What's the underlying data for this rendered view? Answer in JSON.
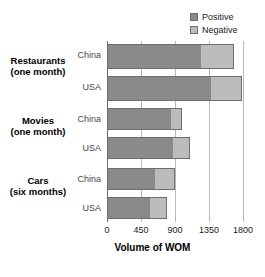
{
  "chart_data": {
    "type": "bar",
    "orientation": "horizontal",
    "stacked": true,
    "title": "",
    "subtitle": "",
    "xlabel": "Volume of WOM",
    "ylabel": "",
    "xlim": [
      0,
      1800
    ],
    "xticks": [
      0,
      450,
      900,
      1350,
      1800
    ],
    "xtick_labels": [
      "0",
      "450",
      "900",
      "1350",
      "1800"
    ],
    "grid": true,
    "legend_position": "top-right",
    "legend": [
      "Positive",
      "Negative"
    ],
    "colors": {
      "Positive": "#8a8a8a",
      "Negative": "#bcbcbc",
      "gridline": "#b9b9b9",
      "axis": "#6b6b6b",
      "bar_border": "#6e6e6e",
      "background": "#ffffff"
    },
    "groups": [
      {
        "name": "Restaurants",
        "period": "(one month)",
        "rows": [
          {
            "label": "China",
            "positive": 1250,
            "negative": 430,
            "total": 1680
          },
          {
            "label": "USA",
            "positive": 1380,
            "negative": 410,
            "total": 1790
          }
        ]
      },
      {
        "name": "Movies",
        "period": "(one month)",
        "rows": [
          {
            "label": "China",
            "positive": 860,
            "negative": 130,
            "total": 990
          },
          {
            "label": "USA",
            "positive": 880,
            "negative": 220,
            "total": 1100
          }
        ]
      },
      {
        "name": "Cars",
        "period": "(six months)",
        "rows": [
          {
            "label": "China",
            "positive": 640,
            "negative": 260,
            "total": 900
          },
          {
            "label": "USA",
            "positive": 570,
            "negative": 220,
            "total": 790
          }
        ]
      }
    ],
    "categories": [
      "Restaurants (one month) - China",
      "Restaurants (one month) - USA",
      "Movies (one month) - China",
      "Movies (one month) - USA",
      "Cars (six months) - China",
      "Cars (six months) - USA"
    ],
    "series": [
      {
        "name": "Positive",
        "values": [
          1250,
          1380,
          860,
          880,
          640,
          570
        ]
      },
      {
        "name": "Negative",
        "values": [
          430,
          410,
          130,
          220,
          260,
          220
        ]
      }
    ]
  }
}
